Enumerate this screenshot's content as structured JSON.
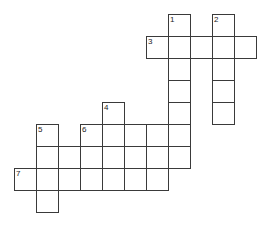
{
  "puzzle": {
    "kind": "crossword-grid",
    "title": "Crossword puzzle grid",
    "canvas": {
      "width": 269,
      "height": 228,
      "background": "#ffffff"
    },
    "geometry": {
      "cell_size": 22,
      "origin_x": 14,
      "origin_y": 14,
      "border_color": "#3a3a3a",
      "cell_fill": "#ffffff",
      "number_color": "#1b1b1b",
      "number_font_size": 8
    },
    "counts": {
      "total_cells": 43,
      "numbered_clues": 7,
      "across_entries": 3,
      "down_entries": 4
    },
    "clue_numbers": [
      "1",
      "2",
      "3",
      "4",
      "5",
      "6",
      "7"
    ],
    "entries": [
      {
        "number": "1",
        "direction": "down",
        "start_col": 7,
        "start_row": 0,
        "length": 8
      },
      {
        "number": "2",
        "direction": "down",
        "start_col": 9,
        "start_row": 0,
        "length": 5
      },
      {
        "number": "3",
        "direction": "across",
        "start_col": 6,
        "start_row": 1,
        "length": 5
      },
      {
        "number": "4",
        "direction": "down",
        "start_col": 4,
        "start_row": 4,
        "length": 4
      },
      {
        "number": "5",
        "direction": "down",
        "start_col": 1,
        "start_row": 5,
        "length": 4
      },
      {
        "number": "6",
        "direction": "across",
        "start_col": 3,
        "start_row": 5,
        "length": 5
      },
      {
        "number": "7",
        "direction": "across",
        "start_col": 0,
        "start_row": 7,
        "length": 7
      }
    ],
    "cells": [
      {
        "col": 7,
        "row": 0,
        "number": "1"
      },
      {
        "col": 9,
        "row": 0,
        "number": "2"
      },
      {
        "col": 6,
        "row": 1,
        "number": "3"
      },
      {
        "col": 7,
        "row": 1,
        "number": ""
      },
      {
        "col": 8,
        "row": 1,
        "number": ""
      },
      {
        "col": 9,
        "row": 1,
        "number": ""
      },
      {
        "col": 10,
        "row": 1,
        "number": ""
      },
      {
        "col": 7,
        "row": 2,
        "number": ""
      },
      {
        "col": 9,
        "row": 2,
        "number": ""
      },
      {
        "col": 7,
        "row": 3,
        "number": ""
      },
      {
        "col": 9,
        "row": 3,
        "number": ""
      },
      {
        "col": 4,
        "row": 4,
        "number": "4"
      },
      {
        "col": 7,
        "row": 4,
        "number": ""
      },
      {
        "col": 9,
        "row": 4,
        "number": ""
      },
      {
        "col": 1,
        "row": 5,
        "number": "5"
      },
      {
        "col": 3,
        "row": 5,
        "number": "6"
      },
      {
        "col": 4,
        "row": 5,
        "number": ""
      },
      {
        "col": 5,
        "row": 5,
        "number": ""
      },
      {
        "col": 6,
        "row": 5,
        "number": ""
      },
      {
        "col": 7,
        "row": 5,
        "number": ""
      },
      {
        "col": 1,
        "row": 6,
        "number": ""
      },
      {
        "col": 2,
        "row": 6,
        "number": ""
      },
      {
        "col": 3,
        "row": 6,
        "number": ""
      },
      {
        "col": 4,
        "row": 6,
        "number": ""
      },
      {
        "col": 5,
        "row": 6,
        "number": ""
      },
      {
        "col": 6,
        "row": 6,
        "number": ""
      },
      {
        "col": 7,
        "row": 6,
        "number": ""
      },
      {
        "col": 0,
        "row": 7,
        "number": "7"
      },
      {
        "col": 1,
        "row": 7,
        "number": ""
      },
      {
        "col": 2,
        "row": 7,
        "number": ""
      },
      {
        "col": 3,
        "row": 7,
        "number": ""
      },
      {
        "col": 4,
        "row": 7,
        "number": ""
      },
      {
        "col": 5,
        "row": 7,
        "number": ""
      },
      {
        "col": 6,
        "row": 7,
        "number": ""
      },
      {
        "col": 1,
        "row": 8,
        "number": ""
      }
    ]
  }
}
